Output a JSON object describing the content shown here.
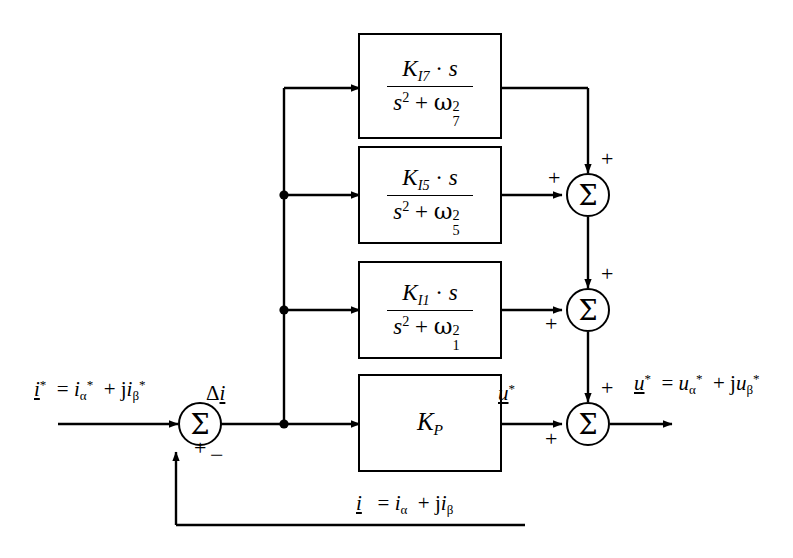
{
  "diagram": {
    "background_color": "#ffffff",
    "line_color": "#000000"
  },
  "signals": {
    "reference_input": "i* = i*α + j i*β",
    "error": "Δi",
    "proportional_output": "u*",
    "output": "u* = u*α + j u*β",
    "feedback": "i = iα + j iβ"
  },
  "blocks": [
    {
      "id": "resonant-7th",
      "name": "K_I7 resonant block",
      "numerator": "K_I7 · s",
      "denominator": "s^2 + ω_7^2",
      "gain_symbol": "K",
      "gain_subscript": "I7",
      "omega_subscript": "7"
    },
    {
      "id": "resonant-5th",
      "name": "K_I5 resonant block",
      "numerator": "K_I5 · s",
      "denominator": "s^2 + ω_5^2",
      "gain_symbol": "K",
      "gain_subscript": "I5",
      "omega_subscript": "5"
    },
    {
      "id": "resonant-1st",
      "name": "K_I1 resonant block",
      "numerator": "K_I1 · s",
      "denominator": "s^2 + ω_1^2",
      "gain_symbol": "K",
      "gain_subscript": "I1",
      "omega_subscript": "1"
    },
    {
      "id": "proportional",
      "name": "Proportional gain block",
      "gain_symbol": "K",
      "gain_subscript": "P",
      "label": "K_P"
    }
  ],
  "summers": [
    {
      "id": "error-summer",
      "symbol": "Σ",
      "input_signs": [
        "+",
        "-"
      ],
      "plus": "+",
      "minus": "−"
    },
    {
      "id": "summer-7th",
      "symbol": "Σ",
      "input_signs": [
        "+",
        "+"
      ],
      "top_sign": "+",
      "left_sign": "+"
    },
    {
      "id": "summer-5th",
      "symbol": "Σ",
      "input_signs": [
        "+",
        "+"
      ],
      "top_sign": "+",
      "left_sign": "+"
    },
    {
      "id": "summer-output",
      "symbol": "Σ",
      "input_signs": [
        "+",
        "+"
      ],
      "top_sign": "+",
      "left_sign": "+"
    }
  ],
  "symbols": {
    "sigma": "Σ",
    "delta": "Δ",
    "omega": "ω",
    "alpha": "α",
    "beta": "β",
    "j": "j",
    "s": "s",
    "star": "*",
    "dot": "·",
    "equals": "=",
    "plus": "+",
    "minus": "−",
    "two": "2"
  }
}
